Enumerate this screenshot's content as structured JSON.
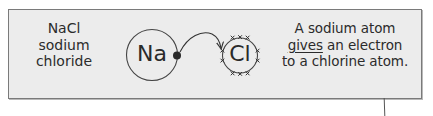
{
  "panel": {
    "background": "#ececec",
    "border_color": "#7a7a7a"
  },
  "formula": {
    "lines": [
      "NaCl",
      "sodium",
      "chloride"
    ]
  },
  "atoms": {
    "sodium": {
      "symbol": "Na",
      "outer_electrons": 1,
      "electron_style": "filled-dot"
    },
    "chlorine": {
      "symbol": "Cl",
      "outer_electrons": 10,
      "electron_style": "x-mark"
    }
  },
  "arrow": {
    "from": "sodium",
    "to": "chlorine",
    "meaning": "electron transfer"
  },
  "caption": {
    "line1": "A sodium atom",
    "line2_underlined": "gives",
    "line2_rest": " an electron",
    "line3": "to a chlorine atom."
  }
}
